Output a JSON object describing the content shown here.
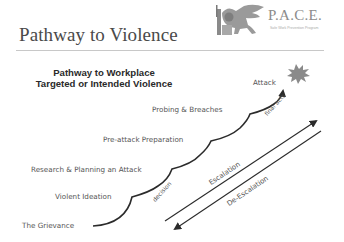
{
  "slide": {
    "title": "Pathway to Violence",
    "logo": {
      "name": "P.A.C.E.",
      "subtitle": "Safe Work Prevention Program",
      "icon": "winged-lion-icon"
    }
  },
  "diagram": {
    "heading_line1": "Pathway to Workplace",
    "heading_line2": "Targeted or Intended Violence",
    "stages": [
      "The Grievance",
      "Violent Ideation",
      "Research & Planning an Attack",
      "Pre-attack Preparation",
      "Probing & Breaches",
      "Attack"
    ],
    "path_labels": {
      "decision": "decision",
      "final_acts": "final acts"
    },
    "arrows": {
      "up": "Escalation",
      "down": "De-Escalation"
    },
    "colors": {
      "line": "#2b2b2b",
      "text": "#555555",
      "burst": "#8a8a8a"
    }
  }
}
